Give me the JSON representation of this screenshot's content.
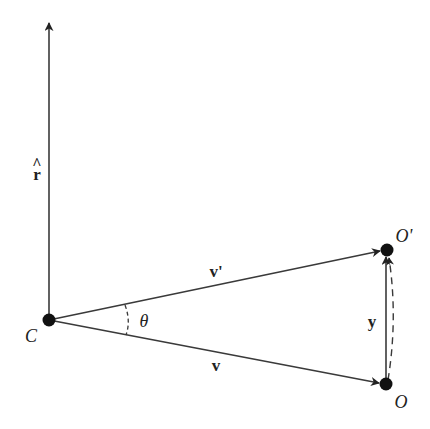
{
  "diagram": {
    "colors": {
      "line": "#3a3a3a",
      "point": "#111111",
      "text": "#222222",
      "background": "#ffffff"
    },
    "points": {
      "C": {
        "label": "C",
        "x": 49,
        "y": 320
      },
      "O": {
        "label": "O",
        "x": 386,
        "y": 384
      },
      "O_prime": {
        "label": "O'",
        "x": 387,
        "y": 250
      }
    },
    "vectors": {
      "r_hat": {
        "label": "r",
        "hat": "^",
        "from": "C",
        "direction": "up"
      },
      "v": {
        "label": "v",
        "from": "C",
        "to": "O"
      },
      "v_prime": {
        "label": "v'",
        "from": "C",
        "to": "O'"
      },
      "y": {
        "label": "y",
        "from": "O",
        "to": "O'"
      }
    },
    "angle": {
      "label": "θ",
      "between": [
        "v",
        "v'"
      ],
      "style": "dashed arc"
    },
    "arc_O_to_O_prime": {
      "style": "dashed curved arrow"
    }
  }
}
